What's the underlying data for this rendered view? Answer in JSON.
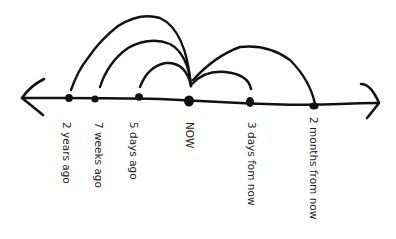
{
  "diagram": {
    "type": "hand-drawn timeline",
    "stroke_color": "#111111",
    "background": "#ffffff",
    "axis": {
      "left_arrow": true,
      "right_arrow": true
    },
    "points": [
      {
        "id": "p0",
        "label": "2 years ago",
        "x": 69,
        "y": 98
      },
      {
        "id": "p1",
        "label": "7 weeks ago",
        "x": 95,
        "y": 99
      },
      {
        "id": "p2",
        "label": "5 days ago",
        "x": 139,
        "y": 97
      },
      {
        "id": "p3",
        "label": "NOW",
        "x": 189,
        "y": 101
      },
      {
        "id": "p4",
        "label": "3 days fom now",
        "x": 250,
        "y": 103
      },
      {
        "id": "p5",
        "label": "2 months from now",
        "x": 314,
        "y": 106
      }
    ],
    "arcs": [
      {
        "from": "NOW",
        "to": "2 years ago"
      },
      {
        "from": "NOW",
        "to": "7 weeks ago"
      },
      {
        "from": "NOW",
        "to": "5 days ago"
      },
      {
        "from": "NOW",
        "to": "3 days fom now"
      },
      {
        "from": "NOW",
        "to": "2 months from now"
      }
    ]
  }
}
